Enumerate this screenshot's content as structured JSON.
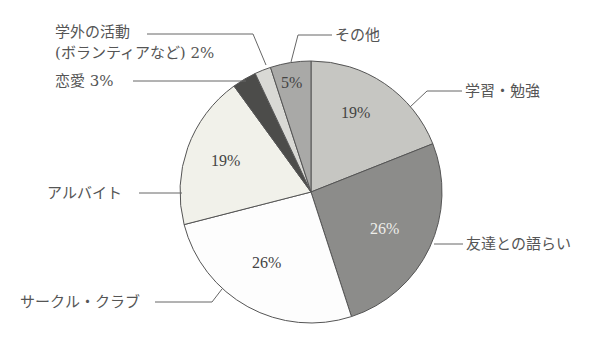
{
  "chart_data": {
    "type": "pie",
    "title": "",
    "start_angle_deg": 0,
    "direction": "clockwise",
    "slices": [
      {
        "label": "学習・勉強",
        "value": 19,
        "display": "19%",
        "color": "#c6c6c2"
      },
      {
        "label": "友達との語らい",
        "value": 26,
        "display": "26%",
        "color": "#8c8c8a"
      },
      {
        "label": "サークル・クラブ",
        "value": 26,
        "display": "26%",
        "color": "#fdfdfd"
      },
      {
        "label": "アルバイト",
        "value": 19,
        "display": "19%",
        "color": "#f1f1ea"
      },
      {
        "label": "恋愛",
        "value": 3,
        "display": "3%",
        "color": "#4c4c4a"
      },
      {
        "label": "学外の活動(ボランティアなど)",
        "value": 2,
        "display": "2%",
        "color": "#d9d9d5"
      },
      {
        "label": "その他",
        "value": 5,
        "display": "5%",
        "color": "#a9a9a7"
      }
    ]
  },
  "labels": {
    "study": "学習・勉強",
    "friends": "友達との語らい",
    "circle": "サークル・クラブ",
    "parttime": "アルバイト",
    "love": "恋愛 3%",
    "outside_line1": "学外の活動",
    "outside_line2": "(ボランティアなど) 2%",
    "other": "その他"
  },
  "inner_labels": {
    "study": "19%",
    "friends": "26%",
    "circle": "26%",
    "parttime": "19%",
    "other": "5%"
  }
}
